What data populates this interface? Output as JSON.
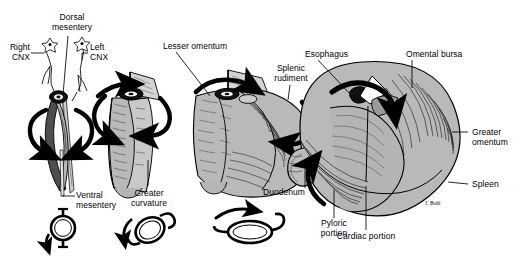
{
  "figure": {
    "type": "anatomical-diagram",
    "background_color": "#ffffff",
    "ink_color": "#000000",
    "fill_gray": "#b9b9b9",
    "fill_gray_dark": "#8d8d8d",
    "fill_gray_light": "#d2d2d2"
  },
  "labels": {
    "dorsal_mesentery": "Dorsal\nmesentery",
    "right_cnx": "Right\nCNX",
    "left_cnx": "Left\nCNX",
    "ventral_mesentery": "Ventral\nmesentery",
    "lesser_omentum": "Lesser omentum",
    "greater_curvature": "Greater\ncurvature",
    "splenic_rudiment": "Splenic\nrudiment",
    "esophagus": "Esophagus",
    "omental_bursa": "Omental bursa",
    "greater_omentum": "Greater\nomentum",
    "spleen": "Spleen",
    "duodenum": "Duodenum",
    "pyloric_portion": "Pyloric\nportion",
    "cardiac_portion": "Cardiac portion",
    "artist_signature": "J. Bohl"
  },
  "stages": [
    {
      "id": "stage-1",
      "name": "primitive-stomach-tube",
      "description": "Straight foregut tube with dorsal and ventral mesentery and vagal trunks",
      "labels": [
        "Dorsal mesentery",
        "Right CNX",
        "Left CNX",
        "Ventral mesentery"
      ],
      "rotation_arrows": 2
    },
    {
      "id": "stage-2",
      "name": "dilating-stomach",
      "description": "Dilated tube with dorsal mesentery flag, greater curvature forming",
      "labels": [
        "Greater curvature"
      ],
      "rotation_arrows": 3
    },
    {
      "id": "stage-3",
      "name": "rotating-stomach",
      "description": "Rotated stomach with lesser omentum and splenic rudiment",
      "labels": [
        "Lesser omentum",
        "Splenic rudiment"
      ],
      "rotation_arrows": 2
    },
    {
      "id": "stage-4",
      "name": "definitive-stomach",
      "description": "Definitive stomach with omental bursa, greater omentum and spleen",
      "labels": [
        "Esophagus",
        "Omental bursa",
        "Greater omentum",
        "Spleen",
        "Duodenum",
        "Pyloric portion",
        "Cardiac portion"
      ],
      "rotation_arrows": 2
    }
  ],
  "cross_sections": [
    {
      "id": "xsec-1",
      "name": "cross-section-unrotated",
      "rotation_degrees": 0,
      "shape": "circle"
    },
    {
      "id": "xsec-2",
      "name": "cross-section-partial-rotation",
      "rotation_degrees": 45,
      "shape": "oval-tilted"
    },
    {
      "id": "xsec-3",
      "name": "cross-section-full-rotation",
      "rotation_degrees": 90,
      "shape": "oval-horizontal"
    }
  ]
}
